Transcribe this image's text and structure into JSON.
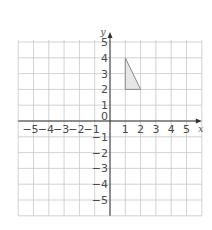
{
  "diagram": {
    "type": "coordinate-grid",
    "x_axis": {
      "label": "x",
      "min": -6,
      "max": 6,
      "ticks": [
        "−5",
        "−4",
        "−3",
        "−2",
        "−1",
        "1",
        "2",
        "3",
        "4",
        "5"
      ],
      "tick_values": [
        -5,
        -4,
        -3,
        -2,
        -1,
        1,
        2,
        3,
        4,
        5
      ]
    },
    "y_axis": {
      "label": "y",
      "min": -6,
      "max": 5,
      "ticks": [
        "5",
        "4",
        "3",
        "2",
        "1",
        "−1",
        "−2",
        "−3",
        "−4",
        "−5"
      ],
      "tick_values": [
        5,
        4,
        3,
        2,
        1,
        -1,
        -2,
        -3,
        -4,
        -5
      ]
    },
    "origin_label": "0",
    "shape": {
      "name": "triangle",
      "vertices": [
        [
          1,
          4
        ],
        [
          1,
          2
        ],
        [
          2,
          2
        ]
      ],
      "fill": "#e6e6e6",
      "stroke": "#8a8a8a"
    },
    "colors": {
      "grid": "#c8c8c8",
      "axis": "#333333",
      "text": "#4a4a4a"
    }
  }
}
